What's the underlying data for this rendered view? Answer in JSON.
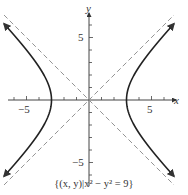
{
  "chart_data": {
    "type": "line",
    "title": "",
    "caption": "{(x, y)|x² − y² = 9}",
    "xlabel": "x",
    "ylabel": "y",
    "xlim": [
      -7,
      7
    ],
    "ylim": [
      -7,
      7
    ],
    "x_ticks": [
      -6,
      -5,
      -4,
      -3,
      -2,
      -1,
      1,
      2,
      3,
      4,
      5,
      6
    ],
    "x_tick_labels": {
      "-5": "−5",
      "5": "5"
    },
    "y_tick_labels": {
      "5": "5",
      "-5": "−5"
    },
    "grid": false,
    "series": [
      {
        "name": "hyperbola right branch",
        "equation": "x^2 - y^2 = 9, x>0",
        "style": "solid",
        "vertex": [
          3,
          0
        ],
        "arrows": "both ends"
      },
      {
        "name": "hyperbola left branch",
        "equation": "x^2 - y^2 = 9, x<0",
        "style": "solid",
        "vertex": [
          -3,
          0
        ],
        "arrows": "both ends"
      },
      {
        "name": "asymptote y = x",
        "style": "dashed"
      },
      {
        "name": "asymptote y = -x",
        "style": "dashed"
      }
    ]
  },
  "labels": {
    "x_axis": "x",
    "y_axis": "y",
    "x_neg5": "−5",
    "x_pos5": "5",
    "y_pos5": "5",
    "y_neg5": "−5",
    "caption": "{(x, y)|x² − y² = 9}"
  },
  "colors": {
    "curve": "#222222",
    "asymptote": "#888888",
    "axis": "#444444"
  }
}
